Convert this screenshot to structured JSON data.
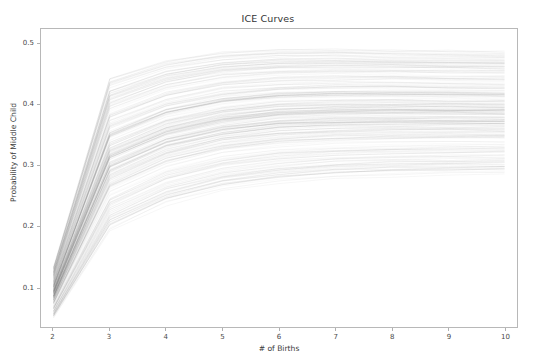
{
  "chart_data": {
    "type": "line",
    "title": "ICE Curves",
    "xlabel": "# of Births",
    "ylabel": "Probability of Middle Child",
    "xlim": [
      1.78,
      10.22
    ],
    "ylim": [
      0.035,
      0.525
    ],
    "xticks": [
      2,
      3,
      4,
      5,
      6,
      7,
      8,
      9,
      10
    ],
    "xtick_labels": [
      "2",
      "3",
      "4",
      "5",
      "6",
      "7",
      "8",
      "9",
      "10"
    ],
    "yticks": [
      0.1,
      0.2,
      0.3,
      0.4,
      0.5
    ],
    "ytick_labels": [
      "0.1",
      "0.2",
      "0.3",
      "0.4",
      "0.5"
    ],
    "grid": false,
    "legend": "none",
    "line_color": "#4d4d4d",
    "line_alpha": 0.06,
    "n_curves": 220,
    "x": [
      2,
      3,
      4,
      5,
      6,
      7,
      8,
      9,
      10
    ],
    "series": [
      {
        "name": "ice-upper-envelope",
        "values": [
          0.132,
          0.441,
          0.47,
          0.484,
          0.489,
          0.489,
          0.487,
          0.486,
          0.485
        ]
      },
      {
        "name": "ice-upper-quartile",
        "values": [
          0.112,
          0.385,
          0.42,
          0.438,
          0.445,
          0.447,
          0.447,
          0.446,
          0.446
        ]
      },
      {
        "name": "ice-median",
        "values": [
          0.092,
          0.318,
          0.358,
          0.378,
          0.388,
          0.391,
          0.392,
          0.392,
          0.391
        ]
      },
      {
        "name": "ice-lower-quartile",
        "values": [
          0.072,
          0.258,
          0.3,
          0.322,
          0.333,
          0.338,
          0.34,
          0.341,
          0.341
        ]
      },
      {
        "name": "ice-lower-envelope",
        "values": [
          0.05,
          0.195,
          0.238,
          0.262,
          0.275,
          0.282,
          0.285,
          0.287,
          0.288
        ]
      }
    ]
  },
  "figure": {
    "background_color": "#ffffff",
    "axes_edge_color": "#b8b8b8",
    "tick_color": "#b0b0b0",
    "text_color": "#3a3a3a"
  }
}
